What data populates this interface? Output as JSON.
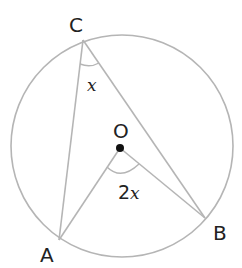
{
  "diagram": {
    "type": "circle-theorem",
    "colors": {
      "line": "#b5b5b5",
      "text": "#222222",
      "center_dot": "#111111",
      "background": "#ffffff"
    },
    "circle": {
      "center": [
        122,
        146
      ],
      "radius": 111
    },
    "points": {
      "A": {
        "label": "A",
        "pos": [
          59,
          240
        ]
      },
      "B": {
        "label": "B",
        "pos": [
          205,
          218
        ]
      },
      "C": {
        "label": "C",
        "pos": [
          83,
          40
        ]
      },
      "O": {
        "label": "O",
        "pos": [
          120,
          148
        ]
      }
    },
    "angles": {
      "inscribed": {
        "vertex": "C",
        "label_var": "x",
        "label_coef": ""
      },
      "central": {
        "vertex": "O",
        "label_var": "x",
        "label_coef": "2"
      }
    }
  }
}
